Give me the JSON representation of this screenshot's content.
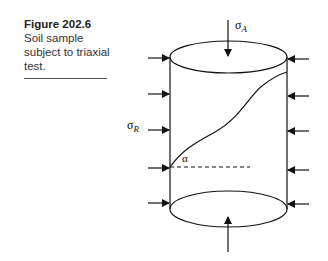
{
  "figure": {
    "number": "Figure 202.6",
    "caption_lines": [
      "Soil sample",
      "subject to triaxial",
      "test."
    ]
  },
  "diagram": {
    "labels": {
      "axial_stress": {
        "symbol": "σ",
        "subscript": "A"
      },
      "radial_stress": {
        "symbol": "σ",
        "subscript": "R"
      },
      "angle": "α"
    },
    "line_color": "#111111"
  }
}
